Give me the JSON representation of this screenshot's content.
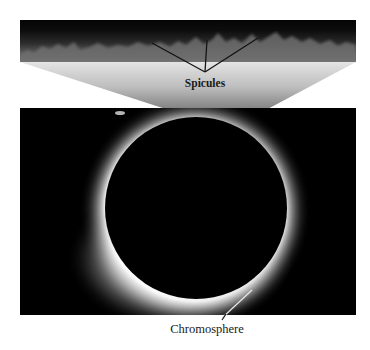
{
  "figure": {
    "top_panel": {
      "description": "close-up of spicules at solar limb",
      "label": "Spicules"
    },
    "bottom_panel": {
      "description": "total solar eclipse showing chromosphere ring around moon disk",
      "label": "Chromosphere"
    }
  }
}
